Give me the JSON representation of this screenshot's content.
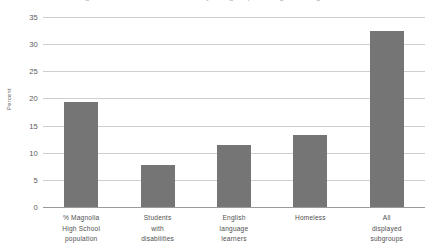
{
  "chart_data": {
    "type": "bar",
    "title": "Figure 2. Percent of students by subgroup at Magnolia High School",
    "xlabel": "",
    "ylabel": "Percent",
    "categories": [
      "% Magnolia High School population",
      "Students with disabilities",
      "English language learners",
      "Homeless",
      "All displayed subgroups"
    ],
    "category_lines": [
      [
        "% Magnolia",
        "High School",
        "population"
      ],
      [
        "Students",
        "with",
        "disabilities"
      ],
      [
        "English",
        "language",
        "learners"
      ],
      [
        "Homeless"
      ],
      [
        "All",
        "displayed",
        "subgroups"
      ]
    ],
    "values": [
      19.4,
      7.8,
      11.4,
      13.3,
      32.5
    ],
    "ylim": [
      0,
      35
    ],
    "yticks": [
      0,
      5,
      10,
      15,
      20,
      25,
      30,
      35
    ],
    "ytick_labels": [
      "0",
      "5",
      "10",
      "15",
      "20",
      "25",
      "30",
      "35"
    ],
    "grid": true,
    "legend": "none",
    "bar_color": "#757575",
    "gridline_color": "#cfcfcf",
    "baseline_color": "#9a9a9a",
    "text_color": "#4f4f4f"
  }
}
